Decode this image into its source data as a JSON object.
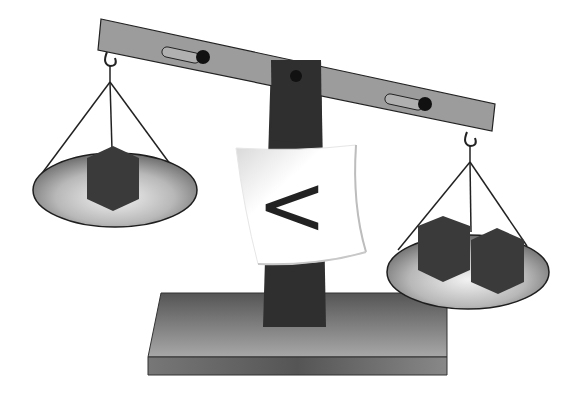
{
  "illustration": {
    "subject": "balance scale comparing weights",
    "comparison_symbol": "<",
    "left_pan": {
      "cube_count": 1
    },
    "right_pan": {
      "cube_count": 2
    },
    "colors": {
      "beam": "#9a9a9a",
      "post": "#2e2e2e",
      "cube": "#3a3a3a",
      "pan_edge": "#1e1e1e",
      "base_top": "#6e6e6e",
      "base_front": "#5a5a5a",
      "background": "#ffffff"
    }
  }
}
